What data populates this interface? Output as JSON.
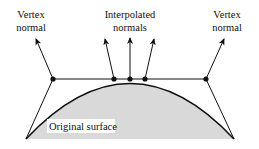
{
  "labels": {
    "vertex_normal_left_line1": "Vertex",
    "vertex_normal_left_line2": "normal",
    "interpolated_line1": "Interpolated",
    "interpolated_line2": "normals",
    "vertex_normal_right_line1": "Vertex",
    "vertex_normal_right_line2": "normal",
    "surface": "Original surface"
  },
  "colors": {
    "surface_fill": "#d9d9d9",
    "stroke": "#111111",
    "background": "#ffffff"
  },
  "geometry": {
    "vertices": [
      [
        53,
        79
      ],
      [
        206,
        79
      ]
    ],
    "interpolated_points": [
      [
        114,
        79
      ],
      [
        130,
        79
      ],
      [
        145,
        79
      ]
    ],
    "surface_base": [
      [
        26,
        139
      ],
      [
        234,
        139
      ]
    ]
  }
}
